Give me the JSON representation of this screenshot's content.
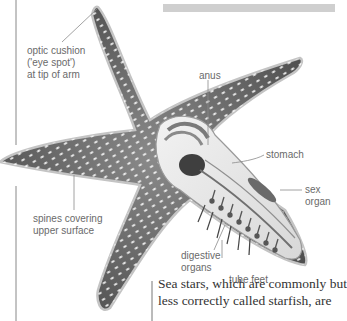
{
  "labels": {
    "optic_cushion": [
      "optic cushion",
      "('eye spot')",
      "at tip of arm"
    ],
    "anus": "anus",
    "stomach": "stomach",
    "sex_organ": [
      "sex",
      "organ"
    ],
    "spines": [
      "spines covering",
      "upper surface"
    ],
    "digestive_organs": [
      "digestive",
      "organs"
    ],
    "tube_feet": "tube feet"
  },
  "body_text": [
    "Sea stars, which are commonly but",
    "less correctly called starfish, are"
  ],
  "colors": {
    "label_text": "#6a6a6a",
    "leader_line": "#8a8a8a",
    "starfish_skin": "#6e6e6e",
    "starfish_outline": "#bdbdbd",
    "header_bar": "#cfcfcf"
  }
}
